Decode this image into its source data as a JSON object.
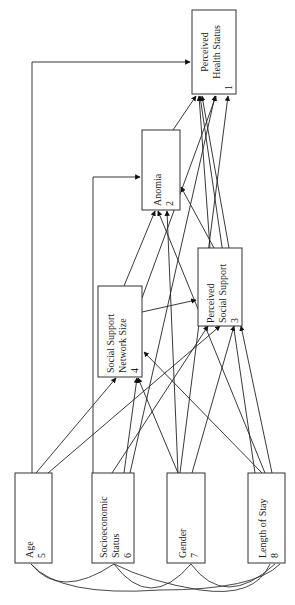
{
  "diagram": {
    "type": "path-diagram",
    "orientation": "rotated-90-ccw",
    "nodes": [
      {
        "id": 1,
        "line1": "Perceived",
        "line2": "Health Status",
        "num": "1"
      },
      {
        "id": 2,
        "line1": "Anomia",
        "line2": "",
        "num": "2"
      },
      {
        "id": 3,
        "line1": "Perceived",
        "line2": "Social Support",
        "num": "3"
      },
      {
        "id": 4,
        "line1": "Social Support",
        "line2": "Network Size",
        "num": "4"
      },
      {
        "id": 5,
        "line1": "Age",
        "line2": "",
        "num": "5"
      },
      {
        "id": 6,
        "line1": "Socioeconomic",
        "line2": "Status",
        "num": "6"
      },
      {
        "id": 7,
        "line1": "Gender",
        "line2": "",
        "num": "7"
      },
      {
        "id": 8,
        "line1": "Length of Stay",
        "line2": "",
        "num": "8"
      }
    ],
    "edges": [
      {
        "from": 5,
        "to": 1
      },
      {
        "from": 6,
        "to": 2
      },
      {
        "from": 2,
        "to": 1
      },
      {
        "from": 3,
        "to": 1
      },
      {
        "from": 4,
        "to": 1
      },
      {
        "from": 7,
        "to": 1
      },
      {
        "from": 8,
        "to": 1
      },
      {
        "from": 4,
        "to": 2
      },
      {
        "from": 7,
        "to": 2
      },
      {
        "from": 3,
        "to": 2
      },
      {
        "from": 4,
        "to": 3
      },
      {
        "from": 5,
        "to": 3
      },
      {
        "from": 6,
        "to": 3
      },
      {
        "from": 7,
        "to": 3
      },
      {
        "from": 8,
        "to": 3
      },
      {
        "from": 5,
        "to": 4
      },
      {
        "from": 7,
        "to": 4
      },
      {
        "from": 8,
        "to": 2
      }
    ],
    "correlations": [
      [
        5,
        6
      ],
      [
        5,
        8
      ],
      [
        6,
        7
      ],
      [
        7,
        8
      ],
      [
        6,
        8
      ],
      [
        5,
        7
      ]
    ]
  }
}
